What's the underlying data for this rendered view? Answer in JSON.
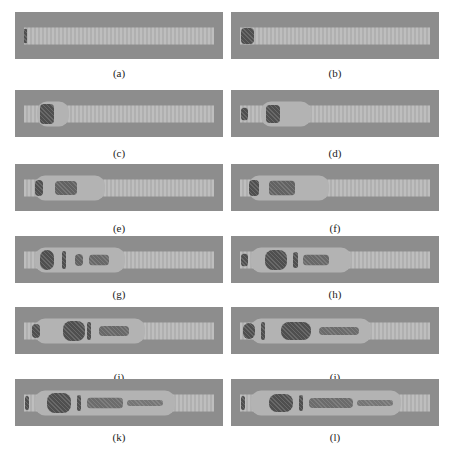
{
  "figure": {
    "panels": [
      {
        "id": "a",
        "label": "(a)"
      },
      {
        "id": "b",
        "label": "(b)"
      },
      {
        "id": "c",
        "label": "(c)"
      },
      {
        "id": "d",
        "label": "(d)"
      },
      {
        "id": "e",
        "label": "(e)"
      },
      {
        "id": "f",
        "label": "(f)"
      },
      {
        "id": "g",
        "label": "(g)"
      },
      {
        "id": "h",
        "label": "(h)"
      },
      {
        "id": "i",
        "label": "(i)"
      },
      {
        "id": "j",
        "label": "(j)"
      },
      {
        "id": "k",
        "label": "(k)"
      },
      {
        "id": "l",
        "label": "(l)"
      }
    ],
    "colors": {
      "background": "#8d8d8d",
      "jet": "#b9b9b9",
      "dense": "#4f4f4f"
    }
  }
}
